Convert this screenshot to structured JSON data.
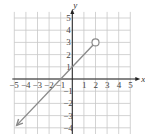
{
  "chart_data": {
    "type": "line",
    "title": "",
    "xlabel": "x",
    "ylabel": "y",
    "xlim": [
      -5,
      5
    ],
    "ylim": [
      -4.5,
      5.5
    ],
    "grid": true,
    "x_ticks": [
      "-5",
      "-4",
      "-3",
      "-2",
      "-1",
      "1",
      "2",
      "3",
      "4",
      "5"
    ],
    "y_ticks": [
      "5",
      "4",
      "3",
      "2",
      "1",
      "-1",
      "-2",
      "-3",
      "-4"
    ],
    "series": [
      {
        "name": "y = x + 1, x < 2",
        "equation": "y = x + 1",
        "x": [
          -4.8,
          2
        ],
        "y": [
          -3.8,
          3
        ],
        "start_arrow": true,
        "end_point": {
          "x": 2,
          "y": 3,
          "style": "open-circle"
        },
        "color": "#8a8a8a"
      }
    ]
  },
  "colors": {
    "grid": "#c8c8c8",
    "axis": "#222222",
    "line": "#8a8a8a"
  }
}
